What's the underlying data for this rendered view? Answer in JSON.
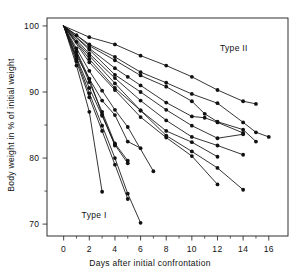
{
  "chart_data": {
    "type": "line",
    "title": "",
    "xlabel": "Days after initial confrontation",
    "ylabel": "Body weight in % of initial weight",
    "xlim": [
      -1.3,
      17.5
    ],
    "ylim": [
      68.2,
      101.2
    ],
    "xticks": [
      0,
      2,
      4,
      6,
      8,
      10,
      12,
      14,
      16
    ],
    "xtick_labels": [
      "0",
      "2",
      "4",
      "6",
      "8",
      "10",
      "12",
      "14",
      "16"
    ],
    "xminor_ticks": [
      1,
      3,
      5,
      7,
      9,
      11,
      13,
      15
    ],
    "yticks": [
      70,
      80,
      90,
      100
    ],
    "ytick_labels": [
      "70",
      "80",
      "90",
      "100"
    ],
    "yminor_ticks": [
      75,
      85,
      95
    ],
    "grid": false,
    "legend": "none",
    "frame": "box",
    "marker": "filled-circle",
    "annotations": [
      {
        "text": "Type II",
        "x": 12.2,
        "y": 96.2
      },
      {
        "text": "Type I",
        "x": 1.4,
        "y": 70.9
      }
    ],
    "series": [
      {
        "name": "type-ii-curve-1",
        "group": "Type II",
        "x": [
          0,
          2,
          4,
          6,
          8,
          10,
          12,
          14,
          15
        ],
        "y": [
          100,
          98.3,
          97.2,
          95.5,
          94.0,
          92.3,
          90.3,
          88.6,
          88.2
        ]
      },
      {
        "name": "type-ii-curve-2",
        "group": "Type II",
        "x": [
          0,
          2,
          4,
          6,
          8,
          10,
          12,
          14,
          15,
          16
        ],
        "y": [
          100,
          97.2,
          95.3,
          93.0,
          91.4,
          89.7,
          88.3,
          85.4,
          83.9,
          83.2
        ]
      },
      {
        "name": "type-ii-curve-3",
        "group": "Type II",
        "x": [
          0,
          1,
          2,
          4,
          6,
          8,
          10,
          11,
          12,
          14,
          15
        ],
        "y": [
          100,
          98.6,
          97.0,
          94.8,
          92.5,
          90.8,
          88.6,
          86.7,
          85.5,
          84.3,
          82.5
        ]
      },
      {
        "name": "type-ii-curve-4",
        "group": "Type II",
        "x": [
          0,
          2,
          4,
          5,
          6,
          8,
          10,
          11,
          12,
          14
        ],
        "y": [
          100,
          96.6,
          93.6,
          92.3,
          91.0,
          88.4,
          86.3,
          86.1,
          85.4,
          83.8
        ]
      },
      {
        "name": "type-ii-curve-5",
        "group": "Type II",
        "x": [
          0,
          2,
          4,
          6,
          8,
          10,
          12,
          14
        ],
        "y": [
          100,
          96.4,
          92.6,
          90.0,
          87.3,
          84.9,
          83.0,
          83.6
        ]
      },
      {
        "name": "type-ii-curve-6",
        "group": "Type II",
        "x": [
          0,
          2,
          4,
          6,
          8,
          10,
          12,
          14
        ],
        "y": [
          100,
          95.8,
          92.1,
          88.7,
          85.7,
          83.2,
          81.9,
          80.5
        ]
      },
      {
        "name": "type-ii-curve-7",
        "group": "Type II",
        "x": [
          0,
          1,
          2,
          4,
          6,
          8,
          10,
          12
        ],
        "y": [
          100,
          97.6,
          95.5,
          91.3,
          87.2,
          84.1,
          82.4,
          80.2
        ]
      },
      {
        "name": "type-ii-curve-8",
        "group": "Type II",
        "x": [
          0,
          2,
          4,
          6,
          8,
          10,
          12,
          14
        ],
        "y": [
          100,
          95.0,
          90.6,
          87.2,
          83.4,
          81.0,
          78.5,
          75.2
        ]
      },
      {
        "name": "type-ii-curve-9",
        "group": "Type II",
        "x": [
          0,
          2,
          4,
          6,
          8,
          10,
          12
        ],
        "y": [
          100,
          94.5,
          90.3,
          86.2,
          83.1,
          80.3,
          76.0
        ]
      },
      {
        "name": "type-i-curve-1",
        "group": "Type I",
        "x": [
          0,
          1,
          2,
          3,
          4,
          5,
          7
        ],
        "y": [
          100,
          96.6,
          93.2,
          90.2,
          87.3,
          84.7,
          78.0
        ]
      },
      {
        "name": "type-i-curve-2",
        "group": "Type I",
        "x": [
          0,
          1,
          2,
          3,
          4,
          5,
          6
        ],
        "y": [
          100,
          95.5,
          92.0,
          88.7,
          86.5,
          82.5,
          81.5
        ]
      },
      {
        "name": "type-i-curve-3",
        "group": "Type I",
        "x": [
          0,
          1,
          2,
          3,
          4,
          5
        ],
        "y": [
          100,
          96.0,
          91.5,
          87.0,
          82.2,
          79.6
        ]
      },
      {
        "name": "type-i-curve-4",
        "group": "Type I",
        "x": [
          0,
          1,
          2,
          3,
          4,
          5
        ],
        "y": [
          100,
          95.2,
          90.6,
          86.4,
          82.0,
          79.2
        ]
      },
      {
        "name": "type-i-curve-5",
        "group": "Type I",
        "x": [
          0,
          1,
          2,
          3,
          4,
          5,
          6
        ],
        "y": [
          100,
          95.0,
          89.8,
          84.9,
          80.0,
          74.6,
          70.2
        ]
      },
      {
        "name": "type-i-curve-6",
        "group": "Type I",
        "x": [
          0,
          1,
          2,
          3,
          4,
          5
        ],
        "y": [
          100,
          94.6,
          89.2,
          84.1,
          79.0,
          73.8
        ]
      },
      {
        "name": "type-i-curve-7",
        "group": "Type I",
        "x": [
          0,
          1,
          2,
          3
        ],
        "y": [
          100,
          94.0,
          87.0,
          74.9
        ]
      },
      {
        "name": "type-i-curve-8",
        "group": "Type I",
        "x": [
          0,
          1,
          2,
          3,
          4
        ],
        "y": [
          100,
          96.2,
          92.0,
          86.6,
          81.9
        ]
      }
    ]
  },
  "figure": {
    "background": "#ffffff",
    "ink": "#111111"
  }
}
